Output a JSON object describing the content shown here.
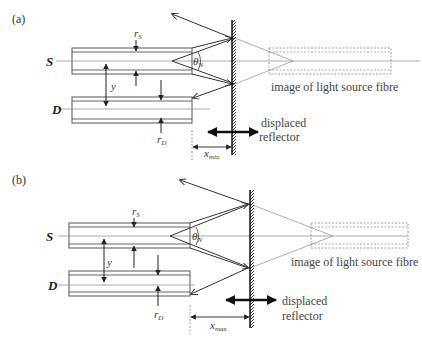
{
  "panels": [
    {
      "id": "a",
      "label": "(a)",
      "source_label": "S",
      "detector_label": "D",
      "source_radius_symbol": "r",
      "source_radius_sub": "S",
      "detector_radius_symbol": "r",
      "detector_radius_sub": "D",
      "separation_symbol": "y",
      "angle_symbol": "θ",
      "angle_sub": "N",
      "distance_symbol": "x",
      "distance_sub": "min",
      "image_caption": "image of light source fibre",
      "reflector_caption_line1": "displaced",
      "reflector_caption_line2": "reflector"
    },
    {
      "id": "b",
      "label": "(b)",
      "source_label": "S",
      "detector_label": "D",
      "source_radius_symbol": "r",
      "source_radius_sub": "S",
      "detector_radius_symbol": "r",
      "detector_radius_sub": "D",
      "separation_symbol": "y",
      "angle_symbol": "θ",
      "angle_sub": "N",
      "distance_symbol": "x",
      "distance_sub": "max",
      "image_caption": "image of light source fibre",
      "reflector_caption_line1": "displaced",
      "reflector_caption_line2": "reflector"
    }
  ],
  "colors": {
    "line": "#333333",
    "thin": "#777777",
    "dashed": "#888888",
    "text": "#333333"
  }
}
